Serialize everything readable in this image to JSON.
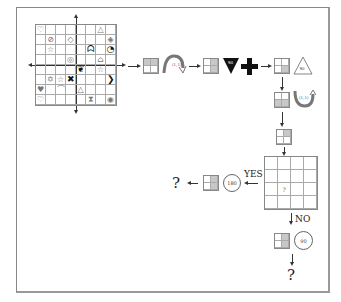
{
  "diagram": {
    "grid_main": {
      "rows": 8,
      "cols": 8,
      "cells": [
        [
          "♡",
          "",
          "",
          "",
          "",
          "",
          "△",
          ""
        ],
        [
          "",
          "⊘",
          "",
          "◇",
          "",
          "",
          "",
          "◈"
        ],
        [
          "",
          "☆",
          "",
          "",
          "",
          "ᗣ",
          "",
          "◔"
        ],
        [
          "",
          "",
          "",
          "◎",
          "",
          "",
          "⌂",
          ""
        ],
        [
          "",
          "",
          "",
          "",
          "❦",
          "",
          "☆",
          ""
        ],
        [
          "",
          "✡",
          "☆",
          "✖",
          "",
          "",
          "",
          "❯"
        ],
        [
          "♥",
          "",
          "⌒",
          "",
          "△",
          "",
          "",
          ""
        ],
        [
          "♡",
          "",
          "",
          "",
          "",
          "⧗",
          "",
          "◉"
        ]
      ]
    },
    "steps": [
      {
        "id": "step1",
        "transform_label": "(1,1)",
        "transform": "curved-arrow-flip"
      },
      {
        "id": "step2",
        "transform_label": "90",
        "transform": "inverted-triangle-plus"
      },
      {
        "id": "step3",
        "transform_label": "90",
        "transform": "triangle"
      },
      {
        "id": "step4",
        "transform_label": "(1,1)",
        "transform": "curved-arrow-down"
      }
    ],
    "decision_grid": {
      "rows": 4,
      "cols": 4,
      "query_cell": "?",
      "query_row": 2,
      "query_col": 1
    },
    "yes_branch": {
      "label": "YES",
      "rotation": "180",
      "result": "?"
    },
    "no_branch": {
      "label": "NO",
      "rotation": "90",
      "result": "?"
    }
  }
}
